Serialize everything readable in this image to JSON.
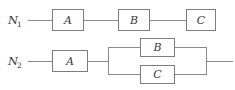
{
  "figure": {
    "type": "reliability-block-diagram",
    "background_color": "#ffffff",
    "line_color": "#8a8a8a",
    "box_border_color": "#7d7d7d",
    "box_fill_color": "#ffffff",
    "text_color": "#3a3a3a"
  },
  "networks": [
    {
      "id": "n1",
      "label_main": "N",
      "label_sub": "1",
      "label_full": "N1",
      "topology": "series",
      "blocks": [
        {
          "id": "n1-a",
          "label": "A"
        },
        {
          "id": "n1-b",
          "label": "B"
        },
        {
          "id": "n1-c",
          "label": "C"
        }
      ]
    },
    {
      "id": "n2",
      "label_main": "N",
      "label_sub": "2",
      "label_full": "N2",
      "topology": "series-parallel",
      "blocks": [
        {
          "id": "n2-a",
          "label": "A"
        },
        {
          "id": "n2-b",
          "label": "B"
        },
        {
          "id": "n2-c",
          "label": "C"
        }
      ],
      "parallel_group": [
        "B",
        "C"
      ]
    }
  ]
}
